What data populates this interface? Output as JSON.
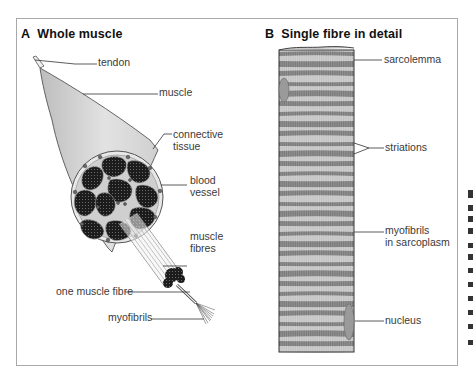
{
  "figure": {
    "panel_a": {
      "letter": "A",
      "title": "Whole muscle",
      "labels": {
        "tendon": "tendon",
        "muscle": "muscle",
        "connective_tissue_1": "connective",
        "connective_tissue_2": "tissue",
        "blood_vessel_1": "blood",
        "blood_vessel_2": "vessel",
        "muscle_fibres_1": "muscle",
        "muscle_fibres_2": "fibres",
        "one_muscle_fibre": "one muscle fibre",
        "myofibrils": "myofibrils"
      }
    },
    "panel_b": {
      "letter": "B",
      "title": "Single fibre in detail",
      "labels": {
        "sarcolemma": "sarcolemma",
        "striations": "striations",
        "myofibrils_1": "myofibrils",
        "myofibrils_2": "in sarcoplasm",
        "nucleus": "nucleus"
      }
    },
    "colors": {
      "frame": "#a9a9a9",
      "muscle_fill": "#d6d6d6",
      "bundle_fill": "#1e1e1e",
      "fibre_dark": "#7a7a7a",
      "fibre_light": "#c4c4c4",
      "nucleus": "#9a9a9a"
    }
  }
}
